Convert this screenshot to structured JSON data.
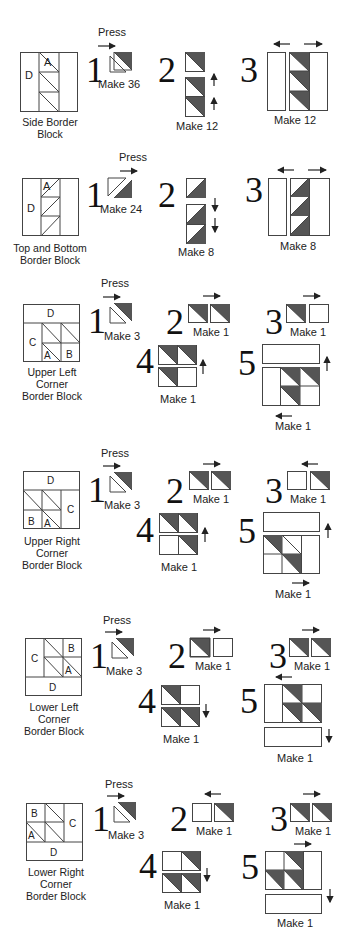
{
  "colors": {
    "dark_fabric": "#555555",
    "print_fabric": "#e8e8e8",
    "line": "#444444"
  },
  "press_label": "Press",
  "sections": [
    {
      "name": "Side Border Block",
      "block_label_lines": [
        "Side Border",
        "Block"
      ],
      "patch_letters": [
        "D",
        "A"
      ],
      "steps": [
        {
          "num": "1",
          "make": "Make 36",
          "press_arrow": "right"
        },
        {
          "num": "2",
          "make": "Make 12",
          "press_arrow": "up"
        },
        {
          "num": "3",
          "make": "Make 12",
          "press_arrow": "left-right"
        }
      ]
    },
    {
      "name": "Top and Bottom Border Block",
      "block_label_lines": [
        "Top and Bottom",
        "Border Block"
      ],
      "patch_letters": [
        "A",
        "D"
      ],
      "steps": [
        {
          "num": "1",
          "make": "Make 24",
          "press_arrow": "right"
        },
        {
          "num": "2",
          "make": "Make 8",
          "press_arrow": "down"
        },
        {
          "num": "3",
          "make": "Make 8",
          "press_arrow": "left-right"
        }
      ]
    },
    {
      "name": "Upper Left Corner Border Block",
      "block_label_lines": [
        "Upper Left",
        "Corner",
        "Border Block"
      ],
      "patch_letters": [
        "D",
        "C",
        "A",
        "B"
      ],
      "steps": [
        {
          "num": "1",
          "make": "Make 3",
          "press_arrow": "right"
        },
        {
          "num": "2",
          "make": "Make 1",
          "press_arrow": "right"
        },
        {
          "num": "3",
          "make": "Make 1",
          "press_arrow": "right"
        },
        {
          "num": "4",
          "make": "Make 1",
          "press_arrow": "up"
        },
        {
          "num": "5",
          "make": "Make 1",
          "press_arrow": "up, left"
        }
      ]
    },
    {
      "name": "Upper Right Corner Border Block",
      "block_label_lines": [
        "Upper Right",
        "Corner",
        "Border Block"
      ],
      "patch_letters": [
        "D",
        "C",
        "B",
        "A"
      ],
      "steps": [
        {
          "num": "1",
          "make": "Make 3",
          "press_arrow": "right"
        },
        {
          "num": "2",
          "make": "Make 1",
          "press_arrow": "right"
        },
        {
          "num": "3",
          "make": "Make 1",
          "press_arrow": "left"
        },
        {
          "num": "4",
          "make": "Make 1",
          "press_arrow": "up"
        },
        {
          "num": "5",
          "make": "Make 1",
          "press_arrow": "up, right"
        }
      ]
    },
    {
      "name": "Lower Left Corner Border Block",
      "block_label_lines": [
        "Lower Left",
        "Corner",
        "Border Block"
      ],
      "patch_letters": [
        "C",
        "B",
        "A",
        "D"
      ],
      "steps": [
        {
          "num": "1",
          "make": "Make 3",
          "press_arrow": "right"
        },
        {
          "num": "2",
          "make": "Make 1",
          "press_arrow": "right"
        },
        {
          "num": "3",
          "make": "Make 1",
          "press_arrow": "right"
        },
        {
          "num": "4",
          "make": "Make 1",
          "press_arrow": "down"
        },
        {
          "num": "5",
          "make": "Make 1",
          "press_arrow": "left, down"
        }
      ]
    },
    {
      "name": "Lower Right Corner Border Block",
      "block_label_lines": [
        "Lower Right",
        "Corner",
        "Border Block"
      ],
      "patch_letters": [
        "B",
        "A",
        "C",
        "D"
      ],
      "steps": [
        {
          "num": "1",
          "make": "Make 3",
          "press_arrow": "right"
        },
        {
          "num": "2",
          "make": "Make 1",
          "press_arrow": "left"
        },
        {
          "num": "3",
          "make": "Make 1",
          "press_arrow": "right"
        },
        {
          "num": "4",
          "make": "Make 1",
          "press_arrow": "down"
        },
        {
          "num": "5",
          "make": "Make 1",
          "press_arrow": "right, down"
        }
      ]
    }
  ]
}
